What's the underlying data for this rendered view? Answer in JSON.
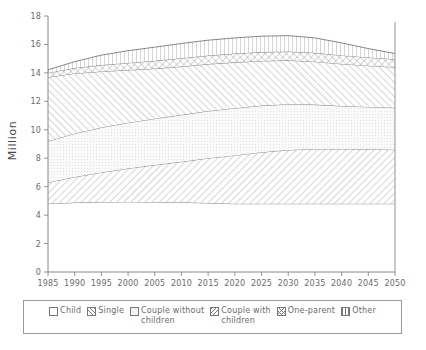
{
  "chart_data": {
    "type": "area",
    "title": "",
    "subtitle": "",
    "xlabel": "",
    "ylabel": "Million",
    "xlim": [
      1985,
      2050
    ],
    "ylim": [
      0,
      18
    ],
    "ytick_step": 2,
    "xtick_step": 5,
    "grid": false,
    "stacked": true,
    "legend_position": "bottom",
    "xticks": [
      "1985",
      "1990",
      "1995",
      "2000",
      "2005",
      "2010",
      "2015",
      "2020",
      "2025",
      "2030",
      "2035",
      "2040",
      "2045",
      "2050"
    ],
    "yticks": [
      "0",
      "2",
      "4",
      "6",
      "8",
      "10",
      "12",
      "14",
      "16",
      "18"
    ],
    "x": [
      1985,
      1990,
      1995,
      2000,
      2005,
      2010,
      2015,
      2020,
      2025,
      2030,
      2035,
      2040,
      2045,
      2050
    ],
    "series": [
      {
        "name": "Child",
        "pattern": "blank",
        "values": [
          4.8,
          4.88,
          4.92,
          4.93,
          4.92,
          4.9,
          4.85,
          4.8,
          4.8,
          4.8,
          4.8,
          4.8,
          4.8,
          4.8
        ]
      },
      {
        "name": "Single",
        "pattern": "diagonal-hatch",
        "values": [
          1.5,
          1.8,
          2.08,
          2.35,
          2.6,
          2.85,
          3.15,
          3.4,
          3.62,
          3.78,
          3.85,
          3.85,
          3.83,
          3.8
        ]
      },
      {
        "name": "Couple without children",
        "pattern": "light-dotted",
        "values": [
          2.9,
          3.06,
          3.16,
          3.22,
          3.26,
          3.3,
          3.32,
          3.32,
          3.28,
          3.22,
          3.12,
          3.02,
          2.98,
          2.95
        ]
      },
      {
        "name": "Couple with children",
        "pattern": "diagonal-hatch",
        "values": [
          4.5,
          4.22,
          3.94,
          3.7,
          3.52,
          3.4,
          3.3,
          3.22,
          3.14,
          3.08,
          3.02,
          2.96,
          2.9,
          2.85
        ]
      },
      {
        "name": "One-parent",
        "pattern": "cross-hatch",
        "values": [
          0.3,
          0.38,
          0.45,
          0.5,
          0.55,
          0.58,
          0.6,
          0.62,
          0.62,
          0.62,
          0.62,
          0.6,
          0.58,
          0.56
        ]
      },
      {
        "name": "Other",
        "pattern": "vertical-lines",
        "values": [
          0.22,
          0.45,
          0.7,
          0.86,
          0.96,
          1.04,
          1.08,
          1.1,
          1.12,
          1.12,
          1.05,
          0.88,
          0.62,
          0.4
        ]
      }
    ],
    "cumulative_totals": [
      14.22,
      14.79,
      15.25,
      15.56,
      15.81,
      16.07,
      16.3,
      16.46,
      16.58,
      16.62,
      16.46,
      16.11,
      15.71,
      15.36
    ]
  },
  "legend": {
    "items": [
      {
        "label": "Child",
        "swatch": "sw-blank"
      },
      {
        "label": "Single",
        "swatch": "sw-diag"
      },
      {
        "label": "Couple without\nchildren",
        "swatch": "sw-dots"
      },
      {
        "label": "Couple with\nchildren",
        "swatch": "sw-diag2"
      },
      {
        "label": "One-parent",
        "swatch": "sw-cross"
      },
      {
        "label": "Other",
        "swatch": "sw-vert"
      }
    ]
  },
  "axis": {
    "y_title": "Million"
  },
  "caption": {
    "text": ""
  },
  "colors": {
    "ink": "#6b6b6b",
    "line": "#555555",
    "frame": "#9a9a9a",
    "dotted_fill": "#f2f2f2"
  }
}
